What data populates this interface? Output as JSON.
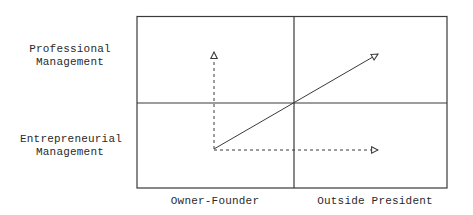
{
  "y_axis": {
    "labels": [
      {
        "line1": "Professional",
        "line2": "Management"
      },
      {
        "line1": "Entrepreneurial",
        "line2": "Management"
      }
    ]
  },
  "x_axis": {
    "labels": [
      "Owner-Founder",
      "Outside President"
    ]
  },
  "arrows": [
    {
      "name": "vertical-dashed-arrow",
      "style": "dashed",
      "from": "origin",
      "to": "professional/owner-founder"
    },
    {
      "name": "diagonal-solid-arrow",
      "style": "solid",
      "from": "origin",
      "to": "professional/outside-president"
    },
    {
      "name": "horizontal-dashed-arrow",
      "style": "dashed",
      "from": "origin",
      "to": "entrepreneurial/outside-president"
    }
  ],
  "colors": {
    "line": "#3a3a3a",
    "background": "#ffffff"
  }
}
